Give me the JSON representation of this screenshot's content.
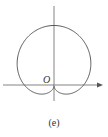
{
  "figure": {
    "caption": "(e)",
    "origin_label": "O",
    "curve": "cardioid r = a(1 + sin θ)",
    "stroke_color": "#555555",
    "axis_color": "#666666"
  }
}
